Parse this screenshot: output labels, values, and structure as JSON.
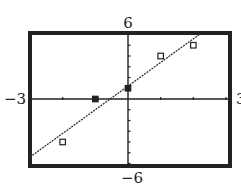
{
  "chart_data": {
    "type": "scatter",
    "title": "",
    "xlabel": "",
    "ylabel": "",
    "xlim": [
      -3,
      3
    ],
    "ylim": [
      -6,
      6
    ],
    "xscl": 1,
    "yscl": 1,
    "grid": false,
    "window_labels": {
      "xmin": "−3",
      "xmax": "3",
      "ymin": "−6",
      "ymax": "6"
    },
    "series": [
      {
        "name": "data points",
        "marker": "open-square",
        "points": [
          {
            "x": -2,
            "y": -4,
            "filled": false
          },
          {
            "x": -1,
            "y": 0,
            "filled": true
          },
          {
            "x": 0,
            "y": 1,
            "filled": true
          },
          {
            "x": 1,
            "y": 4,
            "filled": false
          },
          {
            "x": 2,
            "y": 5,
            "filled": false
          }
        ]
      },
      {
        "name": "regression line",
        "type": "line",
        "slope": 2.2,
        "intercept": 1.2
      }
    ]
  },
  "colors": {
    "ink": "#222222",
    "background": "#ffffff"
  }
}
